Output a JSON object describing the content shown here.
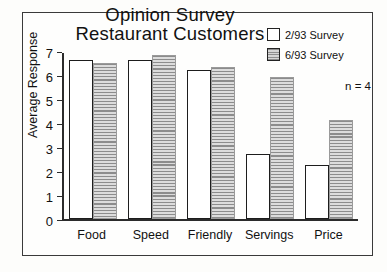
{
  "chart_data": {
    "type": "bar",
    "title": "Opinion Survey",
    "subtitle": "Restaurant Customers",
    "title_lines": [
      "Opinion Survey",
      "Restaurant Customers"
    ],
    "xlabel": "",
    "ylabel": "Average Response",
    "ylim": [
      0,
      7
    ],
    "yticks": [
      0,
      1,
      2,
      3,
      4,
      5,
      6,
      7
    ],
    "ytick_labels": [
      "0",
      "1",
      "2",
      "3",
      "4",
      "5",
      "6",
      "7"
    ],
    "grid": false,
    "legend_position": "top-right",
    "annotation": "n = 4",
    "categories": [
      "Food",
      "Speed",
      "Friendly",
      "Servings",
      "Price"
    ],
    "series": [
      {
        "name": "2/93 Survey",
        "fill": "white",
        "color": "#ffffff",
        "edge_color": "#1d1d1d",
        "values": [
          6.7,
          6.7,
          6.3,
          2.75,
          2.3
        ]
      },
      {
        "name": "6/93 Survey",
        "fill": "horizontal-hatch-gray",
        "color": "#b4b4b4",
        "edge_color": "#9a9a9a",
        "values": [
          6.6,
          6.9,
          6.4,
          6.0,
          4.2
        ]
      }
    ]
  },
  "legend": {
    "entries": [
      {
        "label": "2/93 Survey",
        "swatch": "white-square-icon"
      },
      {
        "label": "6/93 Survey",
        "swatch": "hatched-square-icon"
      }
    ]
  },
  "axes": {
    "y_title": "Average Response",
    "y_ticks": [
      "7",
      "6",
      "5",
      "4",
      "3",
      "2",
      "1",
      "0"
    ],
    "x_categories": [
      "Food",
      "Speed",
      "Friendly",
      "Servings",
      "Price"
    ]
  },
  "annotations": {
    "sample_size": "n = 4"
  },
  "colors": {
    "frame": "#3a3a3a",
    "axis": "#2b2b2b",
    "background": "#fdfdfb",
    "series1": "#ffffff",
    "series2": "#b4b4b4"
  }
}
